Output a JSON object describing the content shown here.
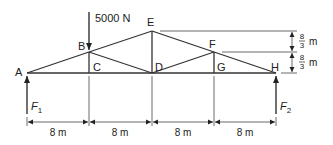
{
  "diagram": {
    "title": "",
    "joints": {
      "A": "A",
      "B": "B",
      "C": "C",
      "D": "D",
      "E": "E",
      "F": "F",
      "G": "G",
      "H": "H"
    },
    "load": {
      "label": "5000 N",
      "at": "B",
      "direction": "down"
    },
    "reactions": [
      {
        "label": "F",
        "subscript": "1",
        "at": "A",
        "direction": "up"
      },
      {
        "label": "F",
        "subscript": "2",
        "at": "H",
        "direction": "up"
      }
    ],
    "horizontal_spans": [
      "8 m",
      "8 m",
      "8 m",
      "8 m"
    ],
    "vertical_dims": [
      {
        "numerator": "8",
        "denominator": "3",
        "unit": "m"
      },
      {
        "numerator": "8",
        "denominator": "3",
        "unit": "m"
      }
    ],
    "members": [
      "AB",
      "BE",
      "EF",
      "FH",
      "AC",
      "CD",
      "DG",
      "GH",
      "BC",
      "BD",
      "DE",
      "DF",
      "FG"
    ],
    "colors": {
      "line": "#333333",
      "text": "#222222",
      "background": "#ffffff"
    }
  }
}
